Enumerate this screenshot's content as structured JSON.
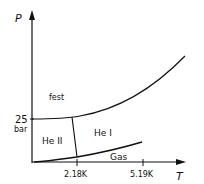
{
  "diagram": {
    "type": "phase-diagram",
    "axes": {
      "y_label": "P",
      "x_label": "T",
      "y_tick_value": "25",
      "y_tick_unit": "bar",
      "x_ticks": [
        "2.18K",
        "5.19K"
      ]
    },
    "regions": {
      "solid": "fest",
      "superfluid": "He II",
      "normal_liquid": "He I",
      "gas": "Gas"
    },
    "colors": {
      "line": "#111111",
      "background": "#ffffff"
    }
  }
}
